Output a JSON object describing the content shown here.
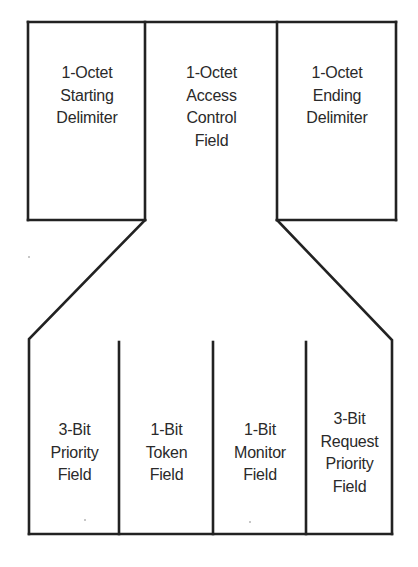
{
  "diagram": {
    "title": "",
    "type": "field-breakdown",
    "stroke_color": "#222222",
    "text_color": "#2a2a2a",
    "background": "#ffffff",
    "top_fields": [
      {
        "id": "starting-delimiter",
        "lines": [
          "1-Octet",
          "Starting",
          "Delimiter"
        ]
      },
      {
        "id": "access-control",
        "lines": [
          "1-Octet",
          "Access",
          "Control",
          "Field"
        ]
      },
      {
        "id": "ending-delimiter",
        "lines": [
          "1-Octet",
          "Ending",
          "Delimiter"
        ]
      }
    ],
    "expanded_from": "access-control",
    "bottom_fields": [
      {
        "id": "priority",
        "lines": [
          "3-Bit",
          "Priority",
          "Field"
        ]
      },
      {
        "id": "token",
        "lines": [
          "1-Bit",
          "Token",
          "Field"
        ]
      },
      {
        "id": "monitor",
        "lines": [
          "1-Bit",
          "Monitor",
          "Field"
        ]
      },
      {
        "id": "request-priority",
        "lines": [
          "3-Bit",
          "Request",
          "Priority",
          "Field"
        ]
      }
    ]
  }
}
